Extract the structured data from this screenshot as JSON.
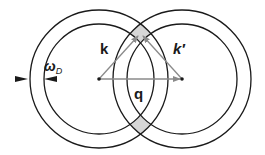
{
  "diagram": {
    "labels": {
      "k": "k",
      "k_prime": "k′",
      "q": "q",
      "omega": "ω",
      "omega_sub": "D"
    },
    "circles": {
      "left_center": [
        99,
        79
      ],
      "right_center": [
        182,
        79
      ],
      "outer_radius": 69,
      "inner_radius": 55
    },
    "colors": {
      "stroke": "#1a1a1a",
      "vector": "#8a8a8a",
      "shaded_region": "#d6d6d6"
    }
  }
}
